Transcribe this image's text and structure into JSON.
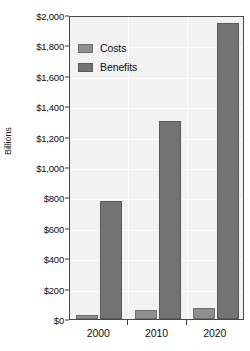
{
  "chart_data": {
    "type": "bar",
    "title": "",
    "xlabel": "",
    "ylabel": "Billions",
    "categories": [
      "2000",
      "2010",
      "2020"
    ],
    "series": [
      {
        "name": "Costs",
        "values": [
          25,
          60,
          70
        ],
        "color": "#8f8f8f"
      },
      {
        "name": "Benefits",
        "values": [
          775,
          1300,
          1950
        ],
        "color": "#737373"
      }
    ],
    "ylim": [
      0,
      2000
    ],
    "ytick_step": 200,
    "ytick_labels": [
      "$0",
      "$200",
      "$400",
      "$600",
      "$800",
      "$1,000",
      "$1,200",
      "$1,400",
      "$1,600",
      "$1,800",
      "$2,000"
    ],
    "ytick_values": [
      0,
      200,
      400,
      600,
      800,
      1000,
      1200,
      1400,
      1600,
      1800,
      2000
    ],
    "grid": true,
    "legend_position": "top-left",
    "plot_background": "#f2f2f2",
    "frame_color": "#4a4a4a"
  },
  "legend": {
    "entries": [
      {
        "label": "Costs"
      },
      {
        "label": "Benefits"
      }
    ]
  },
  "axes": {
    "y_title": "Billions"
  }
}
